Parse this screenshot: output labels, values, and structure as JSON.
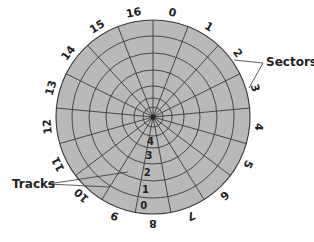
{
  "disk": {
    "center": [
      153,
      117
    ],
    "track_radii": [
      97,
      81,
      64,
      47,
      31,
      19,
      10
    ],
    "fill_color": "#b9b9b9",
    "line_color": "#3a3a3a",
    "sector_count": 17,
    "sector_labels": [
      "0",
      "1",
      "2",
      "3",
      "4",
      "5",
      "6",
      "7",
      "8",
      "9",
      "10",
      "11",
      "12",
      "13",
      "14",
      "15",
      "16"
    ],
    "track_labels": [
      "0",
      "1",
      "2",
      "3",
      "4"
    ]
  },
  "callouts": {
    "sectors": "Sectors",
    "tracks": "Tracks"
  }
}
